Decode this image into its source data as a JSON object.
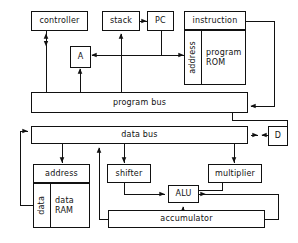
{
  "diagram": {
    "stroke_color": "#111111",
    "background_color": "#ffffff",
    "nodes": {
      "controller": {
        "label": "controller"
      },
      "stack": {
        "label": "stack"
      },
      "pc": {
        "label": "PC"
      },
      "instruction": {
        "label": "instruction"
      },
      "a_register": {
        "label": "A"
      },
      "program_rom_address": {
        "label": "address"
      },
      "program_rom_line1": {
        "label": "program"
      },
      "program_rom_line2": {
        "label": "ROM"
      },
      "program_bus": {
        "label": "program  bus"
      },
      "data_bus": {
        "label": "data  bus"
      },
      "d_register": {
        "label": "D"
      },
      "ram_address": {
        "label": "address"
      },
      "ram_data_port": {
        "label": "data"
      },
      "ram_line1": {
        "label": "data"
      },
      "ram_line2": {
        "label": "RAM"
      },
      "shifter": {
        "label": "shifter"
      },
      "multiplier": {
        "label": "multiplier"
      },
      "alu": {
        "label": "ALU"
      },
      "accumulator": {
        "label": "accumulator"
      }
    }
  }
}
